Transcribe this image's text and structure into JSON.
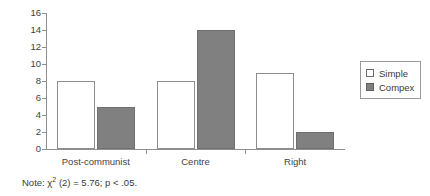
{
  "chart_data": {
    "type": "bar",
    "title": "",
    "xlabel": "",
    "ylabel": "",
    "ylim": [
      0,
      16
    ],
    "yticks": [
      0,
      2,
      4,
      6,
      8,
      10,
      12,
      14,
      16
    ],
    "grid": false,
    "legend_position": "right",
    "categories": [
      "Post-communist",
      "Centre",
      "Right"
    ],
    "series": [
      {
        "name": "Simple",
        "values": [
          8,
          8,
          9
        ],
        "color": "#ffffff"
      },
      {
        "name": "Compex",
        "values": [
          5,
          14,
          2
        ],
        "color": "#808080"
      }
    ],
    "annotations": [
      "Note: χ² (2) = 5.76; p < .05."
    ]
  },
  "legend": {
    "items": [
      {
        "label": "Simple",
        "swatch": "simple"
      },
      {
        "label": "Compex",
        "swatch": "complex"
      }
    ]
  },
  "note": {
    "prefix": "Note: ",
    "chi": "χ",
    "exponent": "2",
    "rest": " (2) = 5.76; p < .05."
  }
}
